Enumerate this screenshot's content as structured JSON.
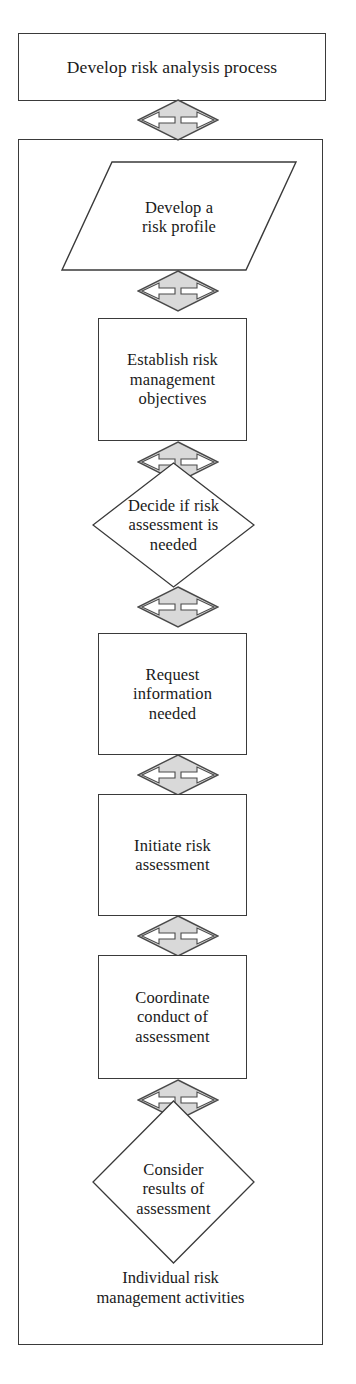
{
  "diagram": {
    "title": "Develop risk analysis process",
    "caption": "Individual risk\nmanagement activities",
    "colors": {
      "stroke": "#3a3a3a",
      "node_fill": "#ffffff",
      "connector_fill": "#d9d9d9",
      "connector_stroke": "#4a4a4a",
      "text": "#1a1a1a"
    },
    "top_box": {
      "label": "Develop risk analysis process",
      "shape": "rectangle"
    },
    "nodes": [
      {
        "id": "develop-risk-profile",
        "shape": "parallelogram",
        "label": "Develop a\nrisk profile"
      },
      {
        "id": "establish-risk-management-objectives",
        "shape": "rectangle",
        "label": "Establish risk\nmanagement\nobjectives"
      },
      {
        "id": "decide-if-risk-assessment-needed",
        "shape": "diamond",
        "label": "Decide if risk\nassessment is\nneeded"
      },
      {
        "id": "request-information-needed",
        "shape": "rectangle",
        "label": "Request\ninformation\nneeded"
      },
      {
        "id": "initiate-risk-assessment",
        "shape": "rectangle",
        "label": "Initiate risk\nassessment"
      },
      {
        "id": "coordinate-conduct-of-assessment",
        "shape": "rectangle",
        "label": "Coordinate\nconduct of\nassessment"
      },
      {
        "id": "consider-results-of-assessment",
        "shape": "diamond",
        "label": "Consider\nresults of\nassessment"
      }
    ],
    "connectors": [
      {
        "id": "connector-1",
        "from": "develop-risk-analysis-process",
        "to": "develop-risk-profile"
      },
      {
        "id": "connector-2",
        "from": "develop-risk-profile",
        "to": "establish-risk-management-objectives"
      },
      {
        "id": "connector-3",
        "from": "establish-risk-management-objectives",
        "to": "decide-if-risk-assessment-needed"
      },
      {
        "id": "connector-4",
        "from": "decide-if-risk-assessment-needed",
        "to": "request-information-needed"
      },
      {
        "id": "connector-5",
        "from": "request-information-needed",
        "to": "initiate-risk-assessment"
      },
      {
        "id": "connector-6",
        "from": "initiate-risk-assessment",
        "to": "coordinate-conduct-of-assessment"
      },
      {
        "id": "connector-7",
        "from": "coordinate-conduct-of-assessment",
        "to": "consider-results-of-assessment"
      }
    ]
  }
}
